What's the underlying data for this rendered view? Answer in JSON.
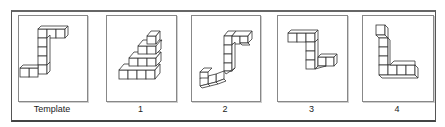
{
  "figure": {
    "panels": [
      {
        "id": "template",
        "label": "Template",
        "left": 18,
        "width": 68
      },
      {
        "id": "option-1",
        "label": "1",
        "left": 106,
        "width": 69
      },
      {
        "id": "option-2",
        "label": "2",
        "left": 191,
        "width": 68
      },
      {
        "id": "option-3",
        "label": "3",
        "left": 277,
        "width": 69
      },
      {
        "id": "option-4",
        "label": "4",
        "left": 362,
        "width": 70
      }
    ]
  },
  "colors": {
    "border": "#555555",
    "panel_border": "#888888",
    "line": "#333333",
    "background": "#ffffff"
  }
}
